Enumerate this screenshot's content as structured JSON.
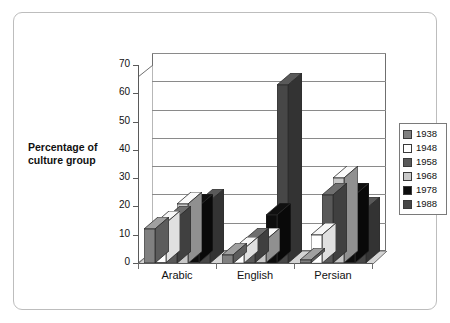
{
  "chart_data": {
    "type": "bar",
    "title": "",
    "subtitle": "",
    "xlabel": "",
    "ylabel": "Percentage of culture group",
    "ylabel_lines": [
      "Percentage of",
      "culture group"
    ],
    "categories": [
      "Arabic",
      "English",
      "Persian"
    ],
    "series": [
      {
        "name": "1938",
        "color": "#808080",
        "values": [
          12,
          3,
          1
        ]
      },
      {
        "name": "1948",
        "color": "#ffffff",
        "values": [
          14,
          5,
          10
        ]
      },
      {
        "name": "1958",
        "color": "#595959",
        "values": [
          16,
          8,
          24
        ]
      },
      {
        "name": "1968",
        "color": "#c8c8c8",
        "values": [
          21,
          8,
          30
        ]
      },
      {
        "name": "1978",
        "color": "#0d0d0d",
        "values": [
          20,
          17,
          24
        ]
      },
      {
        "name": "1988",
        "color": "#474747",
        "values": [
          22,
          63,
          19
        ]
      }
    ],
    "ylim": [
      0,
      70
    ],
    "yticks": [
      0,
      10,
      20,
      30,
      40,
      50,
      60,
      70
    ],
    "ytick_labels": [
      "0",
      "10",
      "20",
      "30",
      "40",
      "50",
      "60",
      "70"
    ],
    "grid": true,
    "legend_position": "right",
    "style": "3d-clustered-column"
  },
  "legend": {
    "items": [
      {
        "label": "1938"
      },
      {
        "label": "1948"
      },
      {
        "label": "1958"
      },
      {
        "label": "1968"
      },
      {
        "label": "1978"
      },
      {
        "label": "1988"
      }
    ]
  }
}
